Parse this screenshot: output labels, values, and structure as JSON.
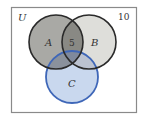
{
  "diagram": {
    "type": "venn",
    "universe": {
      "label": "U",
      "outside_count": "10"
    },
    "sets": [
      {
        "name": "A",
        "label": "A"
      },
      {
        "name": "B",
        "label": "B"
      },
      {
        "name": "C",
        "label": "C"
      }
    ],
    "regions": {
      "A_and_B_only": "5"
    },
    "colors": {
      "frame": "#8a8a8a",
      "circle_ab_stroke": "#2a2a2a",
      "circle_a_fill": "#9a9a95",
      "circle_b_fill": "#d8d8d4",
      "circle_c_stroke": "#3f67b8",
      "circle_c_fill": "#c9d8ee"
    }
  }
}
